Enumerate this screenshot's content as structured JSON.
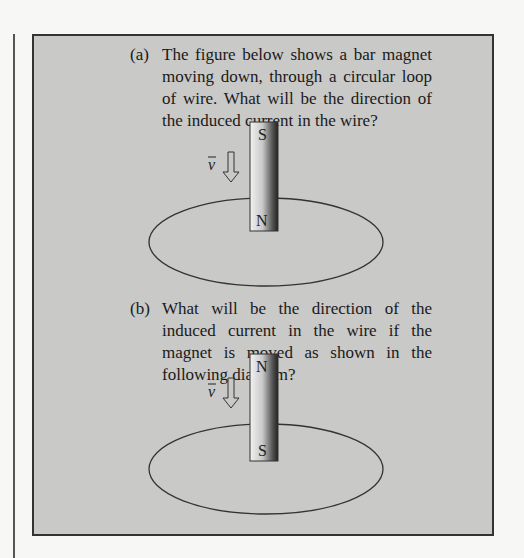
{
  "problems": [
    {
      "label": "(a)",
      "text": "The figure below shows a bar magnet moving down, through a circular loop of wire. What will be the direction of the induced current in the wire?",
      "figure": {
        "magnet_top": "S",
        "magnet_bottom": "N",
        "velocity_label": "v"
      }
    },
    {
      "label": "(b)",
      "text": "What will be the direction of the induced current in the wire if the magnet is moved as shown in the following diagram?",
      "figure": {
        "magnet_top": "N",
        "magnet_bottom": "S",
        "velocity_label": "v"
      }
    }
  ]
}
